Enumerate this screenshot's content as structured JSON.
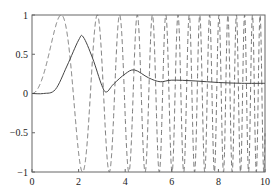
{
  "chart_data": {
    "type": "line",
    "title": "",
    "xlabel": "",
    "ylabel": "",
    "xlim": [
      0,
      10
    ],
    "ylim": [
      -1,
      1
    ],
    "grid": false,
    "legend": null,
    "x_ticks": [
      "0",
      "2",
      "4",
      "6",
      "8",
      "10"
    ],
    "y_ticks": [
      "-1",
      "-0.5",
      "0",
      "0.5",
      "1"
    ],
    "series": [
      {
        "name": "input (dashed chirp)",
        "style": "dashed",
        "color": "#555555",
        "function": "sin(x^2)",
        "x": [
          0,
          0.5,
          1.0,
          1.25,
          1.5,
          1.77,
          2.0,
          2.17,
          2.5,
          2.8,
          3.0,
          3.5,
          4.0,
          5.0,
          6.0,
          7.0,
          8.0,
          9.0,
          10.0
        ],
        "values": [
          0,
          0.25,
          0.84,
          1.0,
          0.78,
          0.0,
          -0.76,
          -1.0,
          0.03,
          1.0,
          0.41,
          -0.31,
          -0.29,
          -0.13,
          -0.99,
          -0.95,
          0.92,
          -0.63,
          -0.51
        ]
      },
      {
        "name": "response (solid)",
        "style": "solid",
        "color": "#444444",
        "x": [
          0,
          0.5,
          1.0,
          1.5,
          2.0,
          2.2,
          2.6,
          3.0,
          3.2,
          3.5,
          4.0,
          4.4,
          5.0,
          5.5,
          6.0,
          7.0,
          8.0,
          9.0,
          10.0
        ],
        "values": [
          0,
          0.0,
          0.05,
          0.35,
          0.68,
          0.72,
          0.45,
          0.1,
          0.02,
          0.12,
          0.25,
          0.3,
          0.2,
          0.15,
          0.17,
          0.16,
          0.14,
          0.13,
          0.13
        ]
      }
    ]
  }
}
